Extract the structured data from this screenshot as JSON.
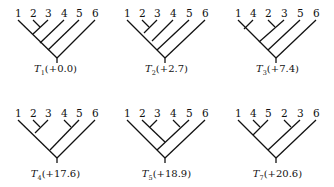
{
  "figure": {
    "trees": [
      {
        "id": "T1",
        "label_main": "T",
        "label_sub": "1",
        "score": "(+0.0)",
        "leaves": [
          "1",
          "2",
          "3",
          "4",
          "5",
          "6"
        ],
        "newick": "(((((1,(2,3)),4),5),6))"
      },
      {
        "id": "T2",
        "label_main": "T",
        "label_sub": "2",
        "score": "(+2.7)",
        "leaves": [
          "1",
          "2",
          "3",
          "4",
          "5",
          "6"
        ],
        "newick": "(1,((((2,3),4),5),6))"
      },
      {
        "id": "T3",
        "label_main": "T",
        "label_sub": "3",
        "score": "(+7.4)",
        "leaves": [
          "1",
          "4",
          "2",
          "3",
          "5",
          "6"
        ],
        "newick": "((((1,4),(2,3)),5),6)"
      },
      {
        "id": "T4",
        "label_main": "T",
        "label_sub": "4",
        "score": "(+17.6)",
        "leaves": [
          "1",
          "2",
          "3",
          "4",
          "5",
          "6"
        ],
        "newick": "(((1,(2,3)),(4,5)),6)"
      },
      {
        "id": "T5",
        "label_main": "T",
        "label_sub": "5",
        "score": "(+18.9)",
        "leaves": [
          "1",
          "2",
          "3",
          "4",
          "5",
          "6"
        ],
        "newick": "(1,(((2,3),(4,5)),6))"
      },
      {
        "id": "T7",
        "label_main": "T",
        "label_sub": "7",
        "score": "(+20.6)",
        "leaves": [
          "1",
          "4",
          "5",
          "2",
          "3",
          "6"
        ],
        "newick": "(((1,(4,5)),(2,3)),6)"
      }
    ]
  }
}
